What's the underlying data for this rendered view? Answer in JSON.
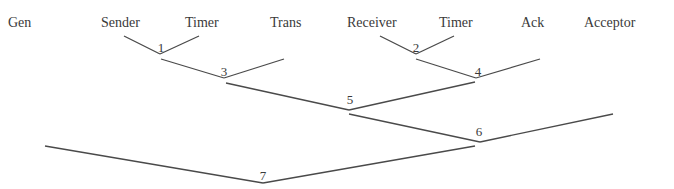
{
  "diagram": {
    "type": "binary-merge-tree",
    "leaves": [
      {
        "id": "gen",
        "label": "Gen",
        "x": 8,
        "y": 15
      },
      {
        "id": "sender",
        "label": "Sender",
        "x": 101,
        "y": 15
      },
      {
        "id": "timer1",
        "label": "Timer",
        "x": 185,
        "y": 15
      },
      {
        "id": "trans",
        "label": "Trans",
        "x": 270,
        "y": 15
      },
      {
        "id": "receiver",
        "label": "Receiver",
        "x": 347,
        "y": 15
      },
      {
        "id": "timer2",
        "label": "Timer",
        "x": 439,
        "y": 15
      },
      {
        "id": "ack",
        "label": "Ack",
        "x": 521,
        "y": 15
      },
      {
        "id": "acceptor",
        "label": "Acceptor",
        "x": 584,
        "y": 15
      }
    ],
    "nodes": [
      {
        "id": "1",
        "label": "1",
        "lx": 161,
        "ly": 40,
        "left": [
          124,
          36
        ],
        "apex": [
          160,
          54
        ],
        "right": [
          199,
          36
        ]
      },
      {
        "id": "3",
        "label": "3",
        "lx": 224,
        "ly": 64,
        "left": [
          161,
          59
        ],
        "apex": [
          224,
          78
        ],
        "right": [
          284,
          59
        ]
      },
      {
        "id": "2",
        "label": "2",
        "lx": 416,
        "ly": 40,
        "left": [
          380,
          36
        ],
        "apex": [
          416,
          54
        ],
        "right": [
          454,
          36
        ]
      },
      {
        "id": "4",
        "label": "4",
        "lx": 478,
        "ly": 64,
        "left": [
          416,
          59
        ],
        "apex": [
          476,
          78
        ],
        "right": [
          540,
          59
        ]
      },
      {
        "id": "5",
        "label": "5",
        "lx": 350,
        "ly": 92,
        "left": [
          226,
          83
        ],
        "apex": [
          349,
          110
        ],
        "right": [
          475,
          82
        ]
      },
      {
        "id": "6",
        "label": "6",
        "lx": 479,
        "ly": 124,
        "left": [
          349,
          114
        ],
        "apex": [
          480,
          142
        ],
        "right": [
          613,
          114
        ]
      },
      {
        "id": "7",
        "label": "7",
        "lx": 263,
        "ly": 168,
        "left": [
          45,
          146
        ],
        "apex": [
          263,
          183
        ],
        "right": [
          475,
          146
        ]
      }
    ]
  }
}
